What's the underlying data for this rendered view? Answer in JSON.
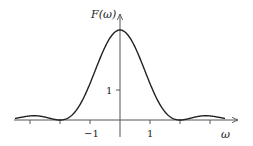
{
  "chart_data": {
    "type": "line",
    "title": "",
    "xlabel": "ω",
    "ylabel": "F(ω)",
    "x_ticks": [
      -3,
      -2,
      -1,
      1,
      2,
      3
    ],
    "x_tick_labels": [
      {
        "value": -1,
        "label": "−1"
      },
      {
        "value": 1,
        "label": "1"
      }
    ],
    "y_ticks": [
      1
    ],
    "y_tick_labels": [
      {
        "value": 1,
        "label": "1"
      }
    ],
    "xlim": [
      -3.4,
      3.4
    ],
    "ylim": [
      0,
      3.6
    ],
    "grid": false,
    "legend": null,
    "series": [
      {
        "name": "F(ω)",
        "description": "sinc-squared shaped spectrum, peak 3 at ω=0, zeros at ω=±2, small side lobes",
        "peak": 3,
        "zeros": [
          -2,
          2
        ],
        "x": [
          -3.4,
          -3.0,
          -2.6,
          -2.2,
          -2.0,
          -1.6,
          -1.2,
          -0.8,
          -0.4,
          0,
          0.4,
          0.8,
          1.2,
          1.6,
          2.0,
          2.2,
          2.6,
          3.0,
          3.4
        ],
        "y": [
          0.07,
          0.13,
          0.1,
          0.03,
          0.0,
          0.14,
          0.7,
          1.55,
          2.55,
          3.0,
          2.55,
          1.55,
          0.7,
          0.14,
          0.0,
          0.03,
          0.1,
          0.13,
          0.07
        ]
      }
    ]
  },
  "labels": {
    "y_axis": "F(ω)",
    "x_axis": "ω",
    "tick_neg1": "−1",
    "tick_pos1": "1",
    "tick_y1": "1"
  }
}
